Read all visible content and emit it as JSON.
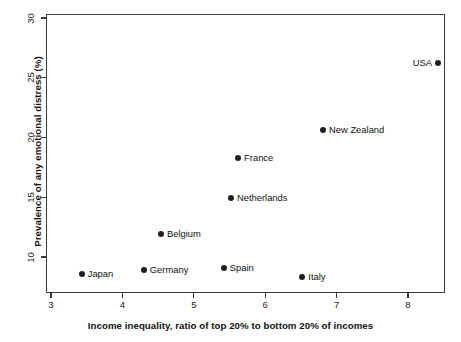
{
  "chart_data": {
    "type": "scatter",
    "title": "",
    "xlabel": "Income inequality, ratio of top 20% to bottom 20% of incomes",
    "ylabel": "Prevalence of any emotional distress (%)",
    "xlim": [
      2.9,
      8.5
    ],
    "ylim": [
      7.6,
      30.2
    ],
    "xticks": [
      "3",
      "4",
      "5",
      "6",
      "7",
      "8"
    ],
    "xtick_values": [
      3,
      4,
      5,
      6,
      7,
      8
    ],
    "yticks": [
      "10",
      "15",
      "20",
      "25",
      "30"
    ],
    "ytick_values": [
      10,
      15,
      20,
      25,
      30
    ],
    "grid": false,
    "legend": "none",
    "points": [
      {
        "label": "Japan",
        "x": 3.43,
        "y": 8.6,
        "label_side": "right"
      },
      {
        "label": "Germany",
        "x": 4.3,
        "y": 8.9,
        "label_side": "right"
      },
      {
        "label": "Belgium",
        "x": 4.54,
        "y": 11.9,
        "label_side": "right"
      },
      {
        "label": "Spain",
        "x": 5.42,
        "y": 9.1,
        "label_side": "right"
      },
      {
        "label": "Netherlands",
        "x": 5.52,
        "y": 14.9,
        "label_side": "right"
      },
      {
        "label": "France",
        "x": 5.62,
        "y": 18.3,
        "label_side": "right"
      },
      {
        "label": "Italy",
        "x": 6.52,
        "y": 8.3,
        "label_side": "right"
      },
      {
        "label": "New Zealand",
        "x": 6.81,
        "y": 20.6,
        "label_side": "right"
      },
      {
        "label": "USA",
        "x": 8.42,
        "y": 26.2,
        "label_side": "left"
      }
    ]
  },
  "style": {
    "point_color": "#1f1f1f",
    "axis_color": "#3a3a3a",
    "text_color": "#111111",
    "background": "#ffffff"
  }
}
